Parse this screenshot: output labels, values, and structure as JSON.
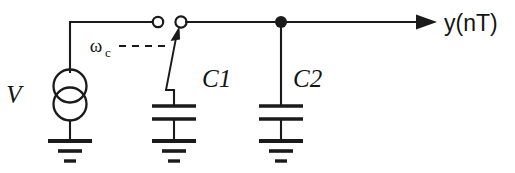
{
  "figure": {
    "background_color": "#ffffff",
    "line_color": "#1a1a1a",
    "width": 515,
    "height": 173
  },
  "labels": {
    "source": "V",
    "clock": "ω",
    "clock_subscript": "c",
    "capacitor1": "C1",
    "capacitor2": "C2",
    "output": "y(nT)"
  },
  "components": [
    {
      "name": "voltage-source",
      "label": "V",
      "type": "source",
      "symbol": "double-overlapping-circle",
      "center_x": 70,
      "center_y": 95
    },
    {
      "name": "switch",
      "label": "ωc",
      "type": "switch",
      "state": "open",
      "left_terminal_x": 158,
      "right_terminal_x": 181,
      "terminal_y": 22
    },
    {
      "name": "capacitor-c1",
      "label": "C1",
      "type": "capacitor",
      "center_x": 174,
      "plate_top_y": 106,
      "plate_bottom_y": 119
    },
    {
      "name": "capacitor-c2",
      "label": "C2",
      "type": "capacitor",
      "center_x": 281,
      "plate_top_y": 106,
      "plate_bottom_y": 119
    },
    {
      "name": "output-node",
      "label": "y(nT)",
      "type": "output-terminal",
      "arrow_tip_x": 437,
      "wire_y": 22
    }
  ],
  "nodes": [
    {
      "name": "junction-c2",
      "x": 281,
      "y": 22,
      "filled": true
    },
    {
      "name": "switch-terminal-left",
      "x": 158,
      "y": 22,
      "filled": false
    },
    {
      "name": "switch-terminal-right",
      "x": 181,
      "y": 22,
      "filled": false
    }
  ],
  "grounds": [
    {
      "name": "ground-source",
      "x": 70,
      "y": 141
    },
    {
      "name": "ground-c1",
      "x": 174,
      "y": 141
    },
    {
      "name": "ground-c2",
      "x": 281,
      "y": 141
    }
  ]
}
